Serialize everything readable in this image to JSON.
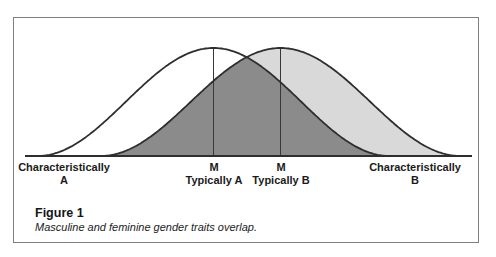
{
  "figure": {
    "caption_title": "Figure 1",
    "caption_text": "Masculine and feminine gender traits overlap.",
    "axis_labels": [
      {
        "line1": "Characteristically",
        "line2": "A"
      },
      {
        "line1": "M",
        "line2": "Typically A"
      },
      {
        "line1": "M",
        "line2": "Typically B"
      },
      {
        "line1": "Characteristically",
        "line2": "B"
      }
    ]
  },
  "chart_data": {
    "type": "area",
    "title": "",
    "curve_shape": "raised-cosine",
    "baseline_y": 156,
    "baseline_x_range": [
      25,
      472
    ],
    "peak_height": 108,
    "curves": [
      {
        "name": "Distribution A",
        "mean_label": "M Typically A",
        "tail_label": "Characteristically A",
        "mean_x": 213.5,
        "half_width": 176,
        "fill": "#ffffff"
      },
      {
        "name": "Distribution B",
        "mean_label": "M Typically B",
        "tail_label": "Characteristically B",
        "mean_x": 280.5,
        "half_width": 180,
        "fill": "#d9d9d9"
      }
    ],
    "overlap_fill": "#8b8b8b",
    "axis_label_x_positions": [
      64,
      214,
      281,
      415
    ],
    "legend_position": "none",
    "grid": false
  },
  "colors": {
    "curve_stroke": "#2e2e2e",
    "mean_line": "#383838",
    "border": "#7f7f7f",
    "text": "#1b1b1b"
  }
}
